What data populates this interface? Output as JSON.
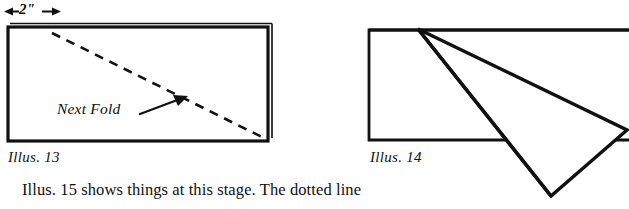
{
  "page": {
    "background_color": "#ffffff",
    "ink_color": "#111111",
    "width": 629,
    "height": 209
  },
  "figures": [
    {
      "id": "illus-13",
      "caption": "Illus. 13",
      "caption_pos": {
        "x": 8,
        "y": 150
      },
      "dimension": {
        "label": "2\"",
        "label_pos": {
          "x": 18,
          "y": 4
        },
        "arrow_left_x": 5,
        "arrow_right_x": 57,
        "arrow_y": 11,
        "icon": "double-headed-arrow-icon"
      },
      "sheet": {
        "shape": "rectangle",
        "x": 8,
        "y": 26,
        "width": 260,
        "height": 115,
        "stroke_width": 3,
        "fold_edge_offset": 5,
        "description": "folded paper sheet shown with doubled right and top edges"
      },
      "fold_line": {
        "style": "dashed",
        "from": {
          "x": 52,
          "y": 33
        },
        "to": {
          "x": 266,
          "y": 139
        },
        "dash": "9 7",
        "stroke_width": 2.4
      },
      "annotation": {
        "label": "Next Fold",
        "label_pos": {
          "x": 58,
          "y": 100
        },
        "pointer_from": {
          "x": 142,
          "y": 114
        },
        "pointer_to": {
          "x": 185,
          "y": 98
        },
        "icon": "arrow-pointer-icon"
      }
    },
    {
      "id": "illus-14",
      "caption": "Illus. 14",
      "caption_pos": {
        "x": 370,
        "y": 150
      },
      "sheet": {
        "shape": "rectangle-clipped-right",
        "x": 368,
        "y": 29,
        "right_x": 629,
        "bottom_y": 141,
        "stroke_width": 2.6,
        "description": "rectangle whose right side runs off the edge of the image"
      },
      "folded_flap": {
        "shape": "triangle-fold",
        "points": [
          {
            "x": 418,
            "y": 29
          },
          {
            "x": 627,
            "y": 130
          },
          {
            "x": 551,
            "y": 196
          }
        ],
        "crease_from": {
          "x": 418,
          "y": 29
        },
        "crease_to": {
          "x": 551,
          "y": 196
        },
        "stroke_width": 3.2,
        "description": "long pointed flap folded down across the sheet"
      }
    }
  ],
  "body_text": {
    "line": "Illus. 15 shows things at this stage. The dotted line",
    "pos": {
      "x": 22,
      "y": 182
    }
  }
}
